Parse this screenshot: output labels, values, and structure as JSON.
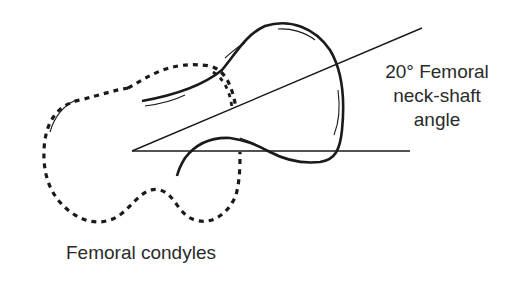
{
  "diagram": {
    "labels": {
      "angle_line1": "20° Femoral",
      "angle_line2": "neck-shaft",
      "angle_line3": "angle",
      "condyles": "Femoral condyles"
    },
    "angle_degrees": 20,
    "colors": {
      "stroke": "#1a1a1a",
      "text": "#2a2a2a",
      "background": "#ffffff"
    }
  }
}
